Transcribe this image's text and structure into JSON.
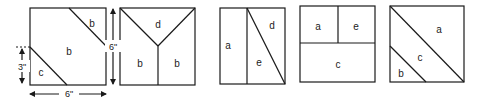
{
  "figure": {
    "stroke_color": "#1a1a1a",
    "background": "#ffffff"
  },
  "dimensions": {
    "width_label": "6\"",
    "height_label": "6\"",
    "offset_label": "3\""
  },
  "squares": [
    {
      "id": 1,
      "pieces": [
        {
          "label": "b",
          "x": 92,
          "y": 24
        },
        {
          "label": "b",
          "x": 69,
          "y": 52
        },
        {
          "label": "c",
          "x": 41,
          "y": 73
        }
      ]
    },
    {
      "id": 2,
      "pieces": [
        {
          "label": "d",
          "x": 158,
          "y": 25
        },
        {
          "label": "b",
          "x": 140,
          "y": 64
        },
        {
          "label": "b",
          "x": 177,
          "y": 64
        }
      ]
    },
    {
      "id": 3,
      "pieces": [
        {
          "label": "d",
          "x": 272,
          "y": 26
        },
        {
          "label": "a",
          "x": 230,
          "y": 46
        },
        {
          "label": "e",
          "x": 259,
          "y": 63
        }
      ]
    },
    {
      "id": 4,
      "pieces": [
        {
          "label": "a",
          "x": 318,
          "y": 27
        },
        {
          "label": "e",
          "x": 357,
          "y": 27
        },
        {
          "label": "c",
          "x": 338,
          "y": 65
        }
      ]
    },
    {
      "id": 5,
      "pieces": [
        {
          "label": "a",
          "x": 439,
          "y": 32
        },
        {
          "label": "c",
          "x": 419,
          "y": 60
        },
        {
          "label": "b",
          "x": 401,
          "y": 76
        }
      ]
    }
  ]
}
